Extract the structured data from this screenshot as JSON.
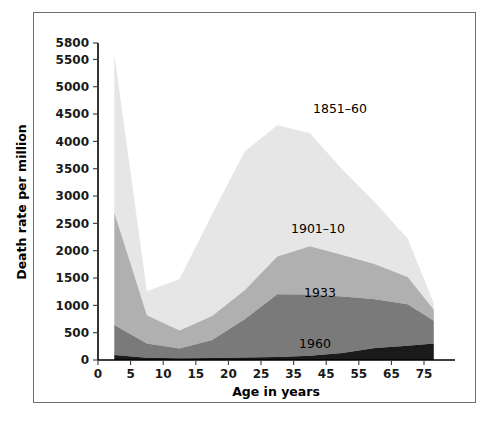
{
  "chart_data": {
    "type": "area",
    "stacked": true,
    "title": "",
    "subtitle": "",
    "xlabel": "Age in years",
    "ylabel": "Death rate per million",
    "x": [
      2.5,
      7.5,
      12.5,
      17.5,
      22.5,
      30,
      40,
      50,
      60,
      70,
      78
    ],
    "xtick_labels": [
      "0",
      "5",
      "10",
      "15",
      "20",
      "25",
      "35",
      "45",
      "55",
      "65",
      "75"
    ],
    "xtick_values": [
      0,
      5,
      10,
      15,
      20,
      25,
      35,
      45,
      55,
      65,
      75
    ],
    "ytick_labels": [
      "0",
      "500",
      "1000",
      "1500",
      "2000",
      "2500",
      "3000",
      "3500",
      "4000",
      "4500",
      "5000",
      "5500",
      "5800"
    ],
    "ytick_values": [
      0,
      500,
      1000,
      1500,
      2000,
      2500,
      3000,
      3500,
      4000,
      4500,
      5000,
      5500,
      5800
    ],
    "ylim": [
      0,
      5800
    ],
    "xlim": [
      0,
      80
    ],
    "grid": false,
    "legend_position": "inline-annotations",
    "series": [
      {
        "name": "1960",
        "label": "1960",
        "color": "#1a1a1a",
        "annotation": "1960",
        "values": [
          90,
          40,
          30,
          35,
          45,
          55,
          80,
          130,
          220,
          260,
          300
        ]
      },
      {
        "name": "1933",
        "label": "1933",
        "color": "#7a7a7a",
        "annotation": "1933",
        "values": [
          550,
          260,
          180,
          330,
          700,
          1150,
          1120,
          1030,
          890,
          760,
          420
        ]
      },
      {
        "name": "1901–10",
        "label": "1901–10",
        "color": "#b0b0b0",
        "annotation": "1901–10",
        "values": [
          2060,
          520,
          330,
          440,
          530,
          690,
          880,
          760,
          640,
          500,
          200
        ]
      },
      {
        "name": "1851–60",
        "label": "1851–60",
        "color": "#e6e6e6",
        "annotation": "1851–60",
        "values": [
          2900,
          440,
          940,
          1860,
          2540,
          2400,
          2070,
          1560,
          1130,
          700,
          120
        ]
      }
    ],
    "series_totals": {
      "note": "cumulative stacked top of each band",
      "1960": [
        90,
        40,
        30,
        35,
        45,
        55,
        80,
        130,
        220,
        260,
        300
      ],
      "1933": [
        640,
        300,
        210,
        365,
        745,
        1205,
        1200,
        1160,
        1110,
        1020,
        720
      ],
      "1901_10": [
        2700,
        820,
        540,
        805,
        1275,
        1895,
        2080,
        1920,
        1750,
        1520,
        920
      ],
      "1851_60": [
        5600,
        1260,
        1480,
        2665,
        3815,
        4295,
        4150,
        3480,
        2880,
        2220,
        1040
      ]
    },
    "annotations": [
      {
        "text": "1851–60",
        "x_px": 340,
        "y_px": 113
      },
      {
        "text": "1901–10",
        "x_px": 318,
        "y_px": 233
      },
      {
        "text": "1933",
        "x_px": 320,
        "y_px": 297
      },
      {
        "text": "1960",
        "x_px": 315,
        "y_px": 348
      }
    ]
  },
  "axes": {
    "x_title": "Age in years",
    "y_title": "Death rate per million"
  }
}
